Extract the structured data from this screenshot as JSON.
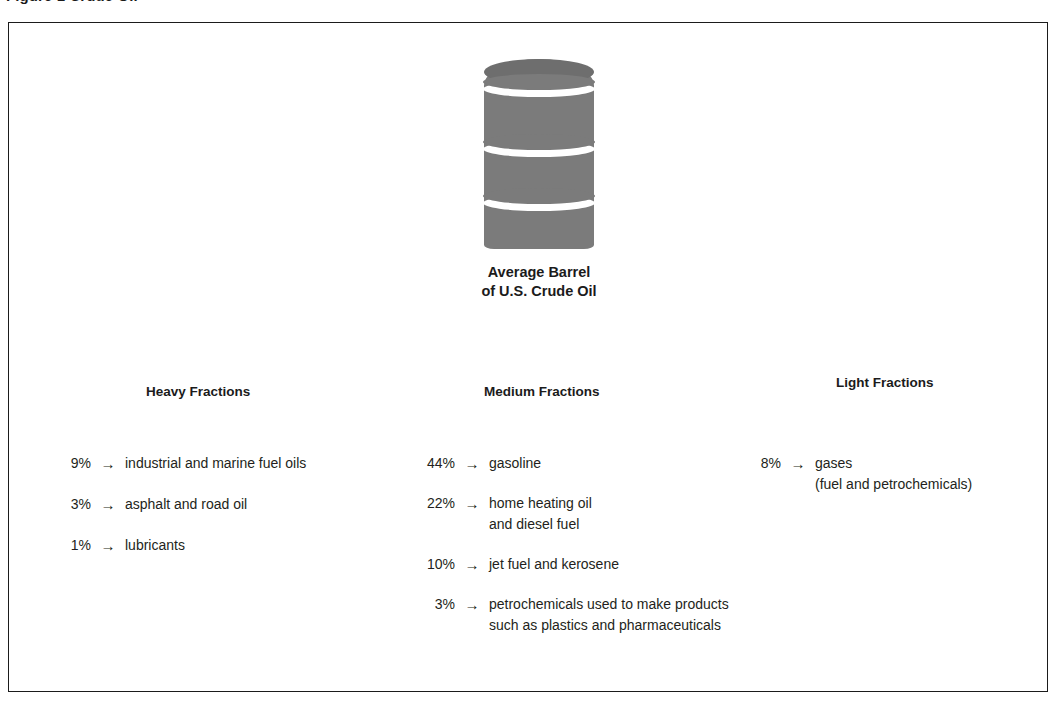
{
  "figure": {
    "caption_clipped": "Figure 1   Crude Oil",
    "frame_color": "#1b1b1b",
    "barrel_color": "#7b7b7b"
  },
  "barrel": {
    "icon": "oil-barrel-icon",
    "caption_line1": "Average Barrel",
    "caption_line2": "of U.S. Crude Oil"
  },
  "columns": [
    {
      "id": "heavy",
      "header": "Heavy Fractions",
      "rows": [
        {
          "pct": "9%",
          "arrow": "→",
          "product": "industrial and marine fuel oils"
        },
        {
          "pct": "3%",
          "arrow": "→",
          "product": "asphalt and road oil"
        },
        {
          "pct": "1%",
          "arrow": "→",
          "product": "lubricants"
        }
      ]
    },
    {
      "id": "medium",
      "header": "Medium Fractions",
      "rows": [
        {
          "pct": "44%",
          "arrow": "→",
          "product": "gasoline"
        },
        {
          "pct": "22%",
          "arrow": "→",
          "product": "home heating oil\nand diesel fuel"
        },
        {
          "pct": "10%",
          "arrow": "→",
          "product": "jet fuel and kerosene"
        },
        {
          "pct": "3%",
          "arrow": "→",
          "product": "petrochemicals used to make products\nsuch as plastics and pharmaceuticals"
        }
      ]
    },
    {
      "id": "light",
      "header": "Light Fractions",
      "rows": [
        {
          "pct": "8%",
          "arrow": "→",
          "product": "gases",
          "note": "(fuel and petrochemicals)"
        }
      ]
    }
  ],
  "chart_data": {
    "type": "table",
    "title": "Average Barrel of U.S. Crude Oil",
    "categories": [
      "industrial and marine fuel oils",
      "asphalt and road oil",
      "lubricants",
      "gasoline",
      "home heating oil and diesel fuel",
      "jet fuel and kerosene",
      "petrochemicals used to make products such as plastics and pharmaceuticals",
      "gases (fuel and petrochemicals)"
    ],
    "values": [
      9,
      3,
      1,
      44,
      22,
      10,
      3,
      8
    ],
    "groups": [
      "Heavy Fractions",
      "Heavy Fractions",
      "Heavy Fractions",
      "Medium Fractions",
      "Medium Fractions",
      "Medium Fractions",
      "Medium Fractions",
      "Light Fractions"
    ],
    "xlabel": "",
    "ylabel": "Percent of barrel",
    "unit": "%"
  }
}
